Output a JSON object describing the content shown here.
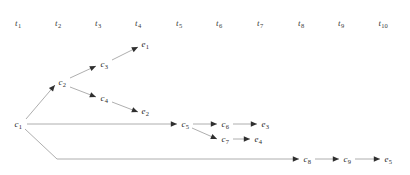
{
  "diagram": {
    "background_color": "#ffffff",
    "edge_color": "#999999",
    "label_color": "#2b2b2b",
    "tick_color": "#3a3a3a",
    "edge_width": 0.8
  },
  "timeline": {
    "axis_name": "time-steps",
    "ticks": [
      {
        "id": "t1",
        "base": "t",
        "index": "1",
        "text": "t1",
        "x": 18,
        "y": 23
      },
      {
        "id": "t2",
        "base": "t",
        "index": "2",
        "text": "t2",
        "x": 58,
        "y": 23
      },
      {
        "id": "t3",
        "base": "t",
        "index": "3",
        "text": "t3",
        "x": 98,
        "y": 23
      },
      {
        "id": "t4",
        "base": "t",
        "index": "4",
        "text": "t4",
        "x": 138,
        "y": 23
      },
      {
        "id": "t5",
        "base": "t",
        "index": "5",
        "text": "t5",
        "x": 179,
        "y": 23
      },
      {
        "id": "t6",
        "base": "t",
        "index": "6",
        "text": "t6",
        "x": 219,
        "y": 23
      },
      {
        "id": "t7",
        "base": "t",
        "index": "7",
        "text": "t7",
        "x": 260,
        "y": 23
      },
      {
        "id": "t8",
        "base": "t",
        "index": "8",
        "text": "t8",
        "x": 301,
        "y": 23
      },
      {
        "id": "t9",
        "base": "t",
        "index": "9",
        "text": "t9",
        "x": 341,
        "y": 23
      },
      {
        "id": "t10",
        "base": "t",
        "index": "10",
        "text": "t10",
        "x": 383,
        "y": 23
      }
    ]
  },
  "nodes": [
    {
      "id": "c1",
      "base": "c",
      "index": "1",
      "text": "c1",
      "kind": "cause",
      "x": 18,
      "y": 124,
      "tick": "t1"
    },
    {
      "id": "c2",
      "base": "c",
      "index": "2",
      "text": "c2",
      "kind": "cause",
      "x": 62,
      "y": 82,
      "tick": "t2"
    },
    {
      "id": "c3",
      "base": "c",
      "index": "3",
      "text": "c3",
      "kind": "cause",
      "x": 104,
      "y": 64,
      "tick": "t3"
    },
    {
      "id": "c4",
      "base": "c",
      "index": "4",
      "text": "c4",
      "kind": "cause",
      "x": 104,
      "y": 98,
      "tick": "t3"
    },
    {
      "id": "e1",
      "base": "e",
      "index": "1",
      "text": "e1",
      "kind": "effect",
      "x": 145,
      "y": 44,
      "tick": "t4"
    },
    {
      "id": "e2",
      "base": "e",
      "index": "2",
      "text": "e2",
      "kind": "effect",
      "x": 145,
      "y": 111,
      "tick": "t4"
    },
    {
      "id": "c5",
      "base": "c",
      "index": "5",
      "text": "c5",
      "kind": "cause",
      "x": 185,
      "y": 124,
      "tick": "t5"
    },
    {
      "id": "c6",
      "base": "c",
      "index": "6",
      "text": "c6",
      "kind": "cause",
      "x": 225,
      "y": 124,
      "tick": "t6"
    },
    {
      "id": "c7",
      "base": "c",
      "index": "7",
      "text": "c7",
      "kind": "cause",
      "x": 225,
      "y": 139,
      "tick": "t6"
    },
    {
      "id": "e3",
      "base": "e",
      "index": "3",
      "text": "e3",
      "kind": "effect",
      "x": 265,
      "y": 124,
      "tick": "t7"
    },
    {
      "id": "e4",
      "base": "e",
      "index": "4",
      "text": "e4",
      "kind": "effect",
      "x": 258,
      "y": 139,
      "tick": "t7"
    },
    {
      "id": "c8",
      "base": "c",
      "index": "8",
      "text": "c8",
      "kind": "cause",
      "x": 307,
      "y": 159,
      "tick": "t8"
    },
    {
      "id": "c9",
      "base": "c",
      "index": "9",
      "text": "c9",
      "kind": "cause",
      "x": 347,
      "y": 159,
      "tick": "t9"
    },
    {
      "id": "e5",
      "base": "e",
      "index": "5",
      "text": "e5",
      "kind": "effect",
      "x": 388,
      "y": 159,
      "tick": "t10"
    }
  ],
  "edges": [
    {
      "id": "c1-c2",
      "from": "c1",
      "to": "c2",
      "path": "M 26,119 L 55,85",
      "arrow_at": [
        55,
        85
      ],
      "arrow_angle": -49.5
    },
    {
      "id": "c2-c3",
      "from": "c2",
      "to": "c3",
      "path": "M 70,78 L 96,66",
      "arrow_at": [
        96,
        66
      ],
      "arrow_angle": -24.8
    },
    {
      "id": "c2-c4",
      "from": "c2",
      "to": "c4",
      "path": "M 70,87 L 96,97",
      "arrow_at": [
        96,
        97
      ],
      "arrow_angle": 21.0
    },
    {
      "id": "c3-e1",
      "from": "c3",
      "to": "e1",
      "path": "M 112,60 L 138,47",
      "arrow_at": [
        138,
        47
      ],
      "arrow_angle": -26.6
    },
    {
      "id": "c4-e2",
      "from": "c4",
      "to": "e2",
      "path": "M 112,102 L 138,112",
      "arrow_at": [
        138,
        112
      ],
      "arrow_angle": 21.0
    },
    {
      "id": "c1-c5",
      "from": "c1",
      "to": "c5",
      "path": "M 27,124 L 177,124",
      "arrow_at": [
        177,
        124
      ],
      "arrow_angle": 0
    },
    {
      "id": "c5-c6",
      "from": "c5",
      "to": "c6",
      "path": "M 193,124 L 217,124",
      "arrow_at": [
        217,
        124
      ],
      "arrow_angle": 0
    },
    {
      "id": "c5-c7",
      "from": "c5",
      "to": "c7",
      "path": "M 192,128 L 217,139",
      "arrow_at": [
        217,
        139
      ],
      "arrow_angle": 23.7
    },
    {
      "id": "c6-e3",
      "from": "c6",
      "to": "e3",
      "path": "M 233,124 L 257,124",
      "arrow_at": [
        257,
        124
      ],
      "arrow_angle": 0
    },
    {
      "id": "c7-e4",
      "from": "c7",
      "to": "e4",
      "path": "M 233,139 L 250,139",
      "arrow_at": [
        250,
        139
      ],
      "arrow_angle": 0
    },
    {
      "id": "c1-c8",
      "from": "c1",
      "to": "c8",
      "path": "M 25,129 L 57,159 L 299,159",
      "arrow_at": [
        299,
        159
      ],
      "arrow_angle": 0
    },
    {
      "id": "c8-c9",
      "from": "c8",
      "to": "c9",
      "path": "M 315,159 L 339,159",
      "arrow_at": [
        339,
        159
      ],
      "arrow_angle": 0
    },
    {
      "id": "c9-e5",
      "from": "c9",
      "to": "e5",
      "path": "M 355,159 L 380,159",
      "arrow_at": [
        380,
        159
      ],
      "arrow_angle": 0
    }
  ]
}
